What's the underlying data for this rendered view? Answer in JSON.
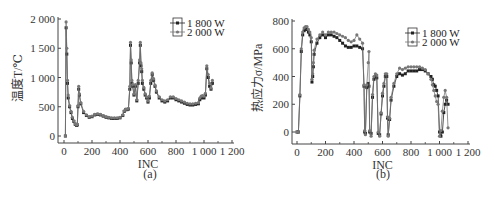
{
  "chart_data": [
    {
      "panel": "(a)",
      "type": "line",
      "title": "",
      "xlabel": "INC",
      "ylabel": "温度T/℃",
      "xlim": [
        0,
        1200
      ],
      "ylim": [
        0,
        2000
      ],
      "xticks": [
        "0",
        "200",
        "400",
        "600",
        "800",
        "1 000",
        "1 200"
      ],
      "yticks": [
        "0",
        "500",
        "1 000",
        "1 500",
        "2 000"
      ],
      "legend": {
        "position": "upper right",
        "entries": [
          "1 800 W",
          "2 000 W"
        ]
      },
      "grid": false,
      "series": [
        {
          "name": "1 800 W",
          "x": [
            10,
            15,
            20,
            25,
            30,
            40,
            50,
            60,
            70,
            80,
            90,
            95,
            100,
            105,
            110,
            120,
            140,
            160,
            180,
            200,
            220,
            240,
            260,
            280,
            300,
            320,
            340,
            360,
            380,
            400,
            420,
            430,
            440,
            450,
            460,
            470,
            475,
            480,
            485,
            490,
            500,
            510,
            520,
            530,
            540,
            545,
            550,
            555,
            560,
            570,
            580,
            590,
            600,
            610,
            620,
            630,
            640,
            650,
            660,
            680,
            700,
            720,
            740,
            760,
            780,
            800,
            820,
            840,
            860,
            880,
            900,
            920,
            940,
            960,
            970,
            980,
            990,
            1000,
            1010,
            1020,
            1030,
            1040,
            1050,
            1060
          ],
          "y": [
            0,
            1850,
            1400,
            900,
            650,
            500,
            400,
            300,
            250,
            200,
            180,
            190,
            500,
            800,
            700,
            550,
            400,
            350,
            320,
            330,
            360,
            370,
            360,
            340,
            320,
            310,
            300,
            300,
            300,
            310,
            350,
            420,
            450,
            450,
            460,
            800,
            1550,
            1250,
            900,
            850,
            700,
            850,
            600,
            900,
            1250,
            1550,
            1200,
            1100,
            900,
            800,
            700,
            650,
            580,
            650,
            900,
            1050,
            950,
            850,
            750,
            650,
            600,
            580,
            600,
            650,
            650,
            620,
            600,
            580,
            560,
            540,
            530,
            530,
            540,
            550,
            620,
            650,
            660,
            650,
            700,
            1150,
            1000,
            850,
            800,
            900
          ],
          "marker": "square"
        },
        {
          "name": "2 000 W",
          "x": [
            10,
            15,
            20,
            25,
            30,
            40,
            50,
            60,
            70,
            80,
            90,
            95,
            100,
            105,
            110,
            120,
            140,
            160,
            180,
            200,
            220,
            240,
            260,
            280,
            300,
            320,
            340,
            360,
            380,
            400,
            420,
            430,
            440,
            450,
            460,
            470,
            475,
            480,
            485,
            490,
            500,
            510,
            520,
            530,
            540,
            545,
            550,
            555,
            560,
            570,
            580,
            590,
            600,
            610,
            620,
            630,
            640,
            650,
            660,
            680,
            700,
            720,
            740,
            760,
            780,
            800,
            820,
            840,
            860,
            880,
            900,
            920,
            940,
            960,
            970,
            980,
            990,
            1000,
            1010,
            1020,
            1030,
            1040,
            1050,
            1060
          ],
          "y": [
            0,
            1950,
            1500,
            950,
            700,
            520,
            420,
            320,
            260,
            210,
            190,
            200,
            520,
            850,
            720,
            570,
            420,
            360,
            330,
            340,
            370,
            380,
            370,
            350,
            330,
            320,
            310,
            310,
            310,
            320,
            360,
            430,
            460,
            460,
            470,
            850,
            1600,
            1300,
            950,
            880,
            720,
            880,
            620,
            950,
            1300,
            1600,
            1250,
            1150,
            950,
            830,
            720,
            670,
            600,
            680,
            950,
            1080,
            980,
            870,
            770,
            670,
            620,
            600,
            620,
            670,
            670,
            640,
            620,
            600,
            580,
            560,
            550,
            550,
            560,
            570,
            650,
            680,
            690,
            680,
            730,
            1200,
            1050,
            900,
            820,
            950
          ],
          "marker": "circle"
        }
      ]
    },
    {
      "panel": "(b)",
      "type": "line",
      "title": "",
      "xlabel": "INC",
      "ylabel": "热应力σ/MPa",
      "xlim": [
        0,
        1200
      ],
      "ylim": [
        -100,
        800
      ],
      "xticks": [
        "0",
        "200",
        "400",
        "600",
        "800",
        "1 000",
        "1 200"
      ],
      "yticks": [
        "0",
        "200",
        "400",
        "600",
        "800"
      ],
      "legend": {
        "position": "upper right",
        "entries": [
          "1 800 W",
          "2 000 W"
        ]
      },
      "grid": false,
      "series": [
        {
          "name": "1 800 W",
          "x": [
            0,
            10,
            20,
            30,
            40,
            50,
            60,
            70,
            80,
            90,
            100,
            105,
            110,
            115,
            120,
            140,
            160,
            180,
            200,
            220,
            240,
            260,
            280,
            300,
            320,
            340,
            360,
            380,
            400,
            420,
            440,
            460,
            470,
            475,
            480,
            490,
            500,
            505,
            510,
            520,
            530,
            540,
            550,
            560,
            570,
            580,
            590,
            600,
            610,
            620,
            630,
            635,
            640,
            650,
            660,
            680,
            700,
            720,
            740,
            760,
            780,
            800,
            820,
            840,
            860,
            880,
            900,
            920,
            940,
            950,
            960,
            970,
            980,
            990,
            1000,
            1010,
            1020,
            1030,
            1040,
            1050,
            1060
          ],
          "y": [
            0,
            0,
            260,
            580,
            700,
            730,
            740,
            740,
            720,
            700,
            650,
            360,
            400,
            470,
            560,
            640,
            680,
            700,
            680,
            700,
            700,
            690,
            680,
            660,
            640,
            620,
            610,
            610,
            620,
            620,
            610,
            600,
            330,
            0,
            -10,
            320,
            350,
            330,
            0,
            -10,
            250,
            380,
            400,
            390,
            -10,
            -20,
            130,
            260,
            330,
            400,
            400,
            100,
            -20,
            90,
            230,
            330,
            400,
            420,
            410,
            420,
            440,
            440,
            440,
            440,
            450,
            450,
            440,
            420,
            400,
            380,
            340,
            330,
            300,
            260,
            0,
            -30,
            0,
            140,
            200,
            230,
            200
          ],
          "marker": "square"
        },
        {
          "name": "2 000 W",
          "x": [
            0,
            10,
            20,
            30,
            40,
            50,
            60,
            70,
            80,
            90,
            100,
            105,
            110,
            115,
            120,
            140,
            160,
            180,
            200,
            220,
            240,
            260,
            280,
            300,
            320,
            340,
            360,
            380,
            400,
            420,
            440,
            460,
            470,
            475,
            480,
            490,
            500,
            505,
            510,
            520,
            530,
            540,
            550,
            560,
            570,
            580,
            590,
            600,
            610,
            620,
            630,
            635,
            640,
            650,
            660,
            680,
            700,
            720,
            740,
            760,
            780,
            800,
            820,
            840,
            860,
            880,
            900,
            920,
            940,
            950,
            960,
            970,
            980,
            990,
            1000,
            1010,
            1020,
            1030,
            1040,
            1050,
            1060
          ],
          "y": [
            0,
            0,
            270,
            600,
            720,
            750,
            760,
            760,
            740,
            720,
            680,
            380,
            420,
            500,
            590,
            670,
            700,
            720,
            700,
            720,
            720,
            720,
            710,
            700,
            690,
            680,
            660,
            650,
            660,
            700,
            670,
            640,
            340,
            10,
            -20,
            340,
            500,
            580,
            10,
            -30,
            270,
            400,
            420,
            410,
            0,
            -30,
            140,
            280,
            350,
            420,
            420,
            110,
            -30,
            100,
            250,
            350,
            420,
            460,
            450,
            460,
            470,
            470,
            470,
            470,
            470,
            460,
            450,
            420,
            380,
            340,
            300,
            260,
            220,
            200,
            -30,
            10,
            150,
            250,
            300,
            250,
            30
          ],
          "marker": "circle"
        }
      ]
    }
  ],
  "labels": {
    "a_caption": "(a)",
    "b_caption": "(b)",
    "a_xlabel": "INC",
    "b_xlabel": "INC",
    "a_ylabel": "温度T/℃",
    "b_ylabel": "热应力σ/MPa",
    "legend_1": "1 800 W",
    "legend_2": "2 000 W"
  }
}
